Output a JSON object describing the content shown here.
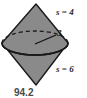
{
  "figure": {
    "type": "bicone-diagram",
    "caption": "94.2",
    "labels": {
      "upper_slant": "s = 4",
      "lower_slant": "s = 6",
      "radius": "3"
    },
    "colors": {
      "fill": "#8a8a8a",
      "outline": "#1a1a1a",
      "hidden_edge": "#1a1a1a",
      "background": "#ffffff",
      "caption": "#4a4a4a",
      "label": "#2b2b2b"
    },
    "geometry": {
      "top_apex": [
        36,
        4
      ],
      "bottom_apex": [
        36,
        85
      ],
      "ellipse_center": [
        35,
        43
      ],
      "ellipse_rx": 33,
      "ellipse_ry": 12,
      "radius_line_start": [
        35,
        44
      ],
      "radius_line_end": [
        56,
        35
      ]
    },
    "values": {
      "upper_slant_height": 4,
      "lower_slant_height": 6,
      "radius": 3,
      "caption_number": 94.2
    }
  }
}
